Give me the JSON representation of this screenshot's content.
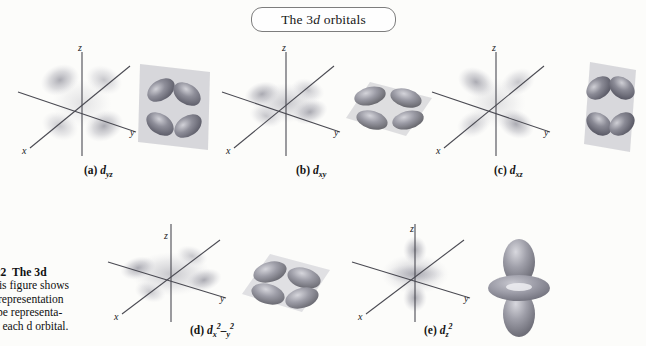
{
  "figure": {
    "title": "The 3d orbitals",
    "title_plain": "The 3d orbitals",
    "title_prefix": "The 3",
    "title_italic": "d",
    "title_suffix": " orbitals"
  },
  "caption": {
    "line1_label": "9.22",
    "line1_bold": "The 3d",
    "line2": "This figure shows",
    "line3": "ot representation",
    "line4": "hape representa-",
    "line5": "for each d orbital."
  },
  "axes": {
    "x": "x",
    "y": "y",
    "z": "z"
  },
  "orbitals": [
    {
      "key": "dyz",
      "letter": "(a)",
      "symbol_base": "d",
      "sub": "yz",
      "sup": "",
      "plane": "yz",
      "shape": "cloverleaf",
      "plane_orientation": "vertical-right"
    },
    {
      "key": "dxy",
      "letter": "(b)",
      "symbol_base": "d",
      "sub": "xy",
      "sup": "",
      "plane": "xy",
      "shape": "cloverleaf",
      "plane_orientation": "horizontal"
    },
    {
      "key": "dxz",
      "letter": "(c)",
      "symbol_base": "d",
      "sub": "xz",
      "sup": "",
      "plane": "xz",
      "shape": "cloverleaf",
      "plane_orientation": "vertical-left"
    },
    {
      "key": "dx2y2",
      "letter": "(d)",
      "symbol_base": "d",
      "sub": "x",
      "sup": "2",
      "sub2": "y",
      "sup2": "2",
      "plane": "xy",
      "shape": "cloverleaf-on-axes",
      "plane_orientation": "horizontal"
    },
    {
      "key": "dz2",
      "letter": "(e)",
      "symbol_base": "d",
      "sub": "z",
      "sup": "2",
      "plane": "z",
      "shape": "dumbbell-torus",
      "plane_orientation": "vertical"
    }
  ],
  "colors": {
    "axis": "#4a4a52",
    "cloud": "#8f8f9a",
    "lobe": "#8c8c96",
    "lobe_dark": "#6f6f7b",
    "plane": "#c9c9cf",
    "text": "#141414",
    "border": "#7d7d7d"
  }
}
